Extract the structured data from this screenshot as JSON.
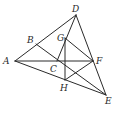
{
  "diagram": {
    "type": "geometry",
    "stroke_color": "#2a2a2a",
    "background": "#ffffff",
    "points": {
      "A": {
        "x": 15,
        "y": 61,
        "label": "A",
        "lx": 3,
        "ly": 64
      },
      "B": {
        "x": 36,
        "y": 44,
        "label": "B",
        "lx": 27,
        "ly": 43
      },
      "C": {
        "x": 57,
        "y": 61,
        "label": "C",
        "lx": 50,
        "ly": 72
      },
      "D": {
        "x": 76,
        "y": 15,
        "label": "D",
        "lx": 72,
        "ly": 12
      },
      "E": {
        "x": 106,
        "y": 95,
        "label": "E",
        "lx": 105,
        "ly": 104
      },
      "F": {
        "x": 93,
        "y": 61,
        "label": "F",
        "lx": 96,
        "ly": 64
      },
      "G": {
        "x": 65,
        "y": 38,
        "label": "G",
        "lx": 57,
        "ly": 41
      },
      "H": {
        "x": 65,
        "y": 80,
        "label": "H",
        "lx": 60,
        "ly": 91
      }
    },
    "segments": [
      [
        "A",
        "D"
      ],
      [
        "A",
        "E"
      ],
      [
        "A",
        "F"
      ],
      [
        "D",
        "E"
      ],
      [
        "B",
        "E"
      ],
      [
        "D",
        "C"
      ],
      [
        "G",
        "H"
      ],
      [
        "G",
        "F"
      ],
      [
        "H",
        "F"
      ]
    ]
  }
}
